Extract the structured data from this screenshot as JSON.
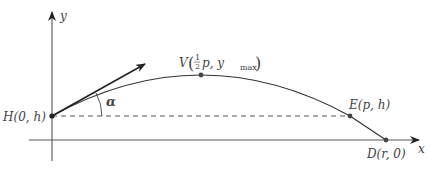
{
  "diagram": {
    "axes": {
      "x_label": "x",
      "y_label": "y"
    },
    "points": {
      "H": {
        "label": "H(0, h)",
        "name": "H",
        "coords": "(0, h)"
      },
      "V": {
        "label_prefix": "V",
        "frac_num": "1",
        "frac_den": "2",
        "label_mid": "p, y",
        "label_sub": "max",
        "name": "V"
      },
      "E": {
        "label": "E(p, h)",
        "name": "E",
        "coords": "(p, h)"
      },
      "D": {
        "label": "D(r, 0)",
        "name": "D",
        "coords": "(r, 0)"
      }
    },
    "angle_label": "α",
    "colors": {
      "curve": "#333333",
      "axis": "#555555",
      "dashed": "#555555",
      "point": "#444444",
      "text": "#444444"
    }
  }
}
